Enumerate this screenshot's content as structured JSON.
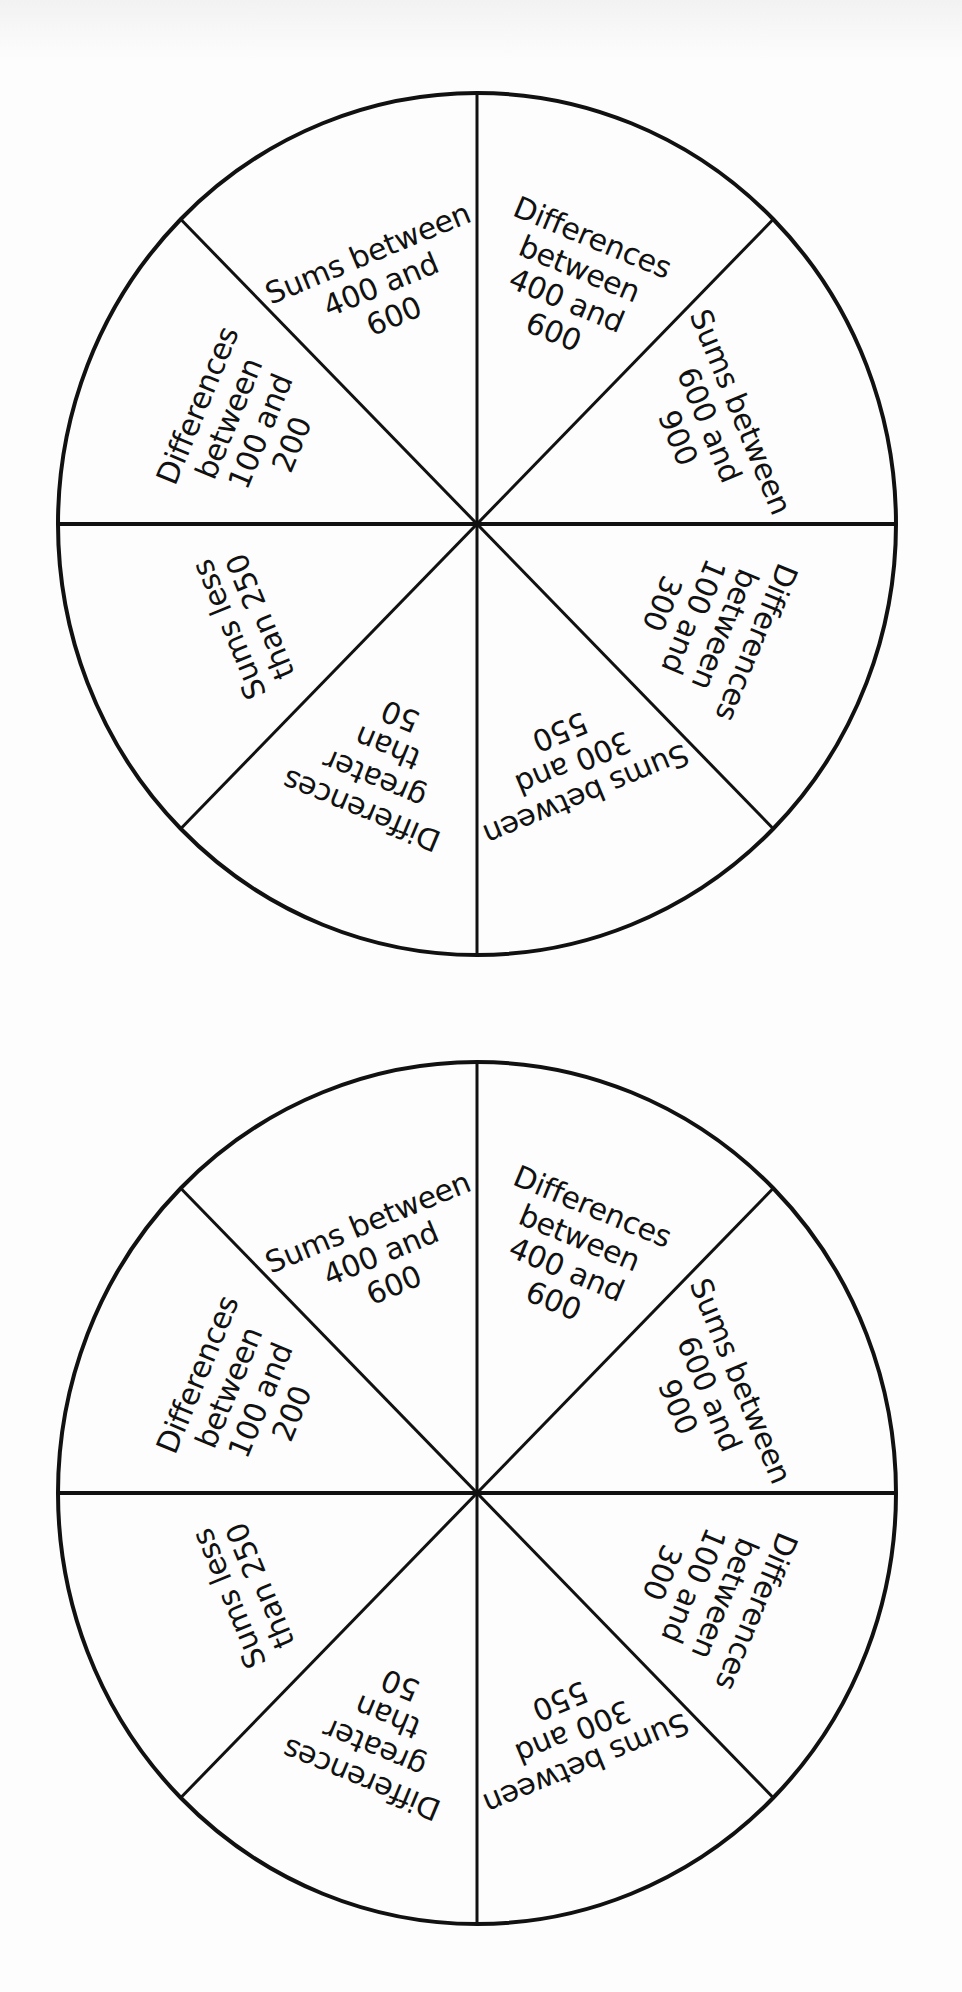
{
  "wheels": [
    {
      "id": "wheel-top",
      "center": [
        477,
        524
      ],
      "radius_x": 419,
      "radius_y": 431,
      "sectors": [
        {
          "label": "Differences\nbetween\n400 and\n600",
          "bisector_deg": 22.5
        },
        {
          "label": "Sums between\n600 and\n900",
          "bisector_deg": 67.5
        },
        {
          "label": "Differences\nbetween\n100 and\n300",
          "bisector_deg": 112.5
        },
        {
          "label": "Sums between\n300 and\n550",
          "bisector_deg": 157.5
        },
        {
          "label": "Differences\ngreater\nthan\n50",
          "bisector_deg": 202.5
        },
        {
          "label": "Sums less\nthan 250",
          "bisector_deg": 247.5
        },
        {
          "label": "Differences\nbetween\n100 and\n200",
          "bisector_deg": 292.5
        },
        {
          "label": "Sums between\n400 and\n600",
          "bisector_deg": 337.5
        }
      ]
    },
    {
      "id": "wheel-bottom",
      "center": [
        477,
        1493
      ],
      "radius_x": 419,
      "radius_y": 431,
      "sectors": [
        {
          "label": "Differences\nbetween\n400 and\n600",
          "bisector_deg": 22.5
        },
        {
          "label": "Sums between\n600 and\n900",
          "bisector_deg": 67.5
        },
        {
          "label": "Differences\nbetween\n100 and\n300",
          "bisector_deg": 112.5
        },
        {
          "label": "Sums between\n300 and\n550",
          "bisector_deg": 157.5
        },
        {
          "label": "Differences\ngreater\nthan\n50",
          "bisector_deg": 202.5
        },
        {
          "label": "Sums less\nthan 250",
          "bisector_deg": 247.5
        },
        {
          "label": "Differences\nbetween\n100 and\n200",
          "bisector_deg": 292.5
        },
        {
          "label": "Sums between\n400 and\n600",
          "bisector_deg": 337.5
        }
      ]
    }
  ],
  "colors": {
    "line": "#111111",
    "background": "#fdfdfd",
    "text": "#111111"
  }
}
